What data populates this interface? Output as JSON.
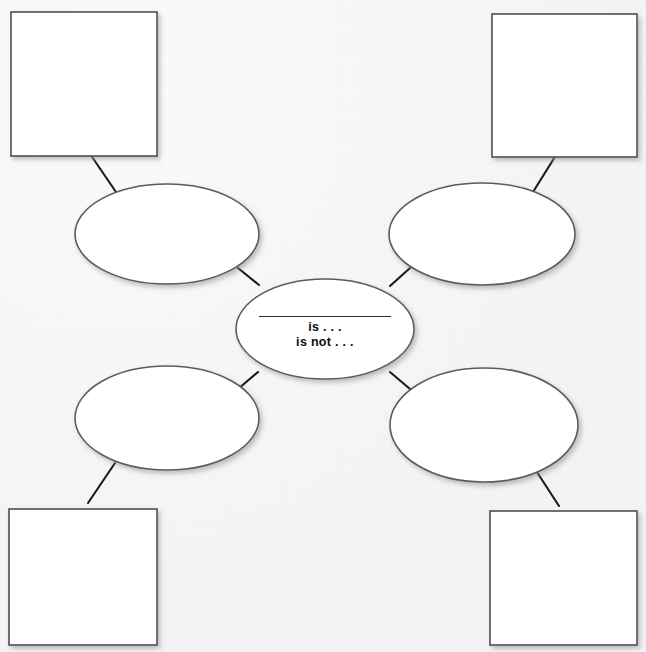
{
  "document": {
    "title": "Concept Definition Graphic Organizer",
    "background_color": "#f5f5f5",
    "stroke_color": "#5a5a5a",
    "connector_color": "#1a1a1a",
    "text_color": "#0d0d0d",
    "width": 646,
    "height": 652
  },
  "center": {
    "name": "center-concept-ellipse",
    "blank_line": "",
    "line_1": "is . . .",
    "line_2": "is not . . ."
  },
  "ellipses": [
    {
      "id": "ellipse-top-left",
      "label": "",
      "position": "top-left"
    },
    {
      "id": "ellipse-top-right",
      "label": "",
      "position": "top-right"
    },
    {
      "id": "ellipse-bottom-left",
      "label": "",
      "position": "bottom-left"
    },
    {
      "id": "ellipse-bottom-right",
      "label": "",
      "position": "bottom-right"
    }
  ],
  "boxes": [
    {
      "id": "box-top-left",
      "label": "",
      "position": "top-left"
    },
    {
      "id": "box-top-right",
      "label": "",
      "position": "top-right"
    },
    {
      "id": "box-bottom-left",
      "label": "",
      "position": "bottom-left"
    },
    {
      "id": "box-bottom-right",
      "label": "",
      "position": "bottom-right"
    }
  ],
  "connectors": [
    {
      "id": "connector-center-to-ellipse-top-left"
    },
    {
      "id": "connector-center-to-ellipse-top-right"
    },
    {
      "id": "connector-center-to-ellipse-bottom-left"
    },
    {
      "id": "connector-center-to-ellipse-bottom-right"
    },
    {
      "id": "connector-ellipse-top-left-to-box-top-left"
    },
    {
      "id": "connector-ellipse-top-right-to-box-top-right"
    },
    {
      "id": "connector-ellipse-bottom-left-to-box-bottom-left"
    },
    {
      "id": "connector-ellipse-bottom-right-to-box-bottom-right"
    }
  ]
}
